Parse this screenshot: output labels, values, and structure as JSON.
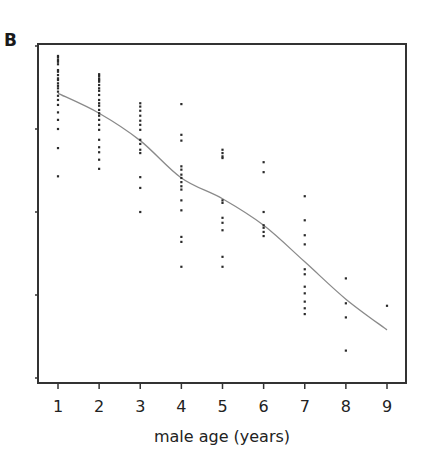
{
  "panel_label": "B",
  "chart_data": {
    "type": "scatter",
    "title": "",
    "xlabel": "male age (years)",
    "ylabel": "",
    "x_ticks": [
      1,
      2,
      3,
      4,
      5,
      6,
      7,
      8,
      9
    ],
    "y_ticks_unlabeled": [
      0,
      1,
      2,
      3,
      4
    ],
    "xlim": [
      0.55,
      9.45
    ],
    "ylim": [
      -0.06,
      4.02
    ],
    "grid": false,
    "legend": null,
    "series": [
      {
        "name": "observations",
        "type": "scatter",
        "points": [
          [
            1,
            3.88
          ],
          [
            1,
            3.86
          ],
          [
            1,
            3.83
          ],
          [
            1,
            3.81
          ],
          [
            1,
            3.78
          ],
          [
            1,
            3.71
          ],
          [
            1,
            3.69
          ],
          [
            1,
            3.65
          ],
          [
            1,
            3.61
          ],
          [
            1,
            3.59
          ],
          [
            1,
            3.55
          ],
          [
            1,
            3.52
          ],
          [
            1,
            3.49
          ],
          [
            1,
            3.45
          ],
          [
            1,
            3.4
          ],
          [
            1,
            3.35
          ],
          [
            1,
            3.29
          ],
          [
            1,
            3.2
          ],
          [
            1,
            3.11
          ],
          [
            1,
            3.0
          ],
          [
            1,
            2.77
          ],
          [
            1,
            2.43
          ],
          [
            2,
            3.66
          ],
          [
            2,
            3.64
          ],
          [
            2,
            3.61
          ],
          [
            2,
            3.59
          ],
          [
            2,
            3.57
          ],
          [
            2,
            3.53
          ],
          [
            2,
            3.49
          ],
          [
            2,
            3.46
          ],
          [
            2,
            3.41
          ],
          [
            2,
            3.35
          ],
          [
            2,
            3.31
          ],
          [
            2,
            3.28
          ],
          [
            2,
            3.23
          ],
          [
            2,
            3.19
          ],
          [
            2,
            3.16
          ],
          [
            2,
            3.11
          ],
          [
            2,
            3.05
          ],
          [
            2,
            2.99
          ],
          [
            2,
            2.87
          ],
          [
            2,
            2.78
          ],
          [
            2,
            2.72
          ],
          [
            2,
            2.63
          ],
          [
            2,
            2.52
          ],
          [
            3,
            3.31
          ],
          [
            3,
            3.27
          ],
          [
            3,
            3.22
          ],
          [
            3,
            3.16
          ],
          [
            3,
            3.1
          ],
          [
            3,
            3.05
          ],
          [
            3,
            2.99
          ],
          [
            3,
            2.87
          ],
          [
            3,
            2.82
          ],
          [
            3,
            2.75
          ],
          [
            3,
            2.71
          ],
          [
            3,
            2.42
          ],
          [
            3,
            2.29
          ],
          [
            3,
            2.0
          ],
          [
            4,
            3.3
          ],
          [
            4,
            2.93
          ],
          [
            4,
            2.86
          ],
          [
            4,
            2.55
          ],
          [
            4,
            2.51
          ],
          [
            4,
            2.45
          ],
          [
            4,
            2.41
          ],
          [
            4,
            2.36
          ],
          [
            4,
            2.31
          ],
          [
            4,
            2.27
          ],
          [
            4,
            2.14
          ],
          [
            4,
            2.02
          ],
          [
            4,
            1.7
          ],
          [
            4,
            1.64
          ],
          [
            4,
            1.34
          ],
          [
            5,
            2.75
          ],
          [
            5,
            2.71
          ],
          [
            5,
            2.67
          ],
          [
            5,
            2.65
          ],
          [
            5,
            2.14
          ],
          [
            5,
            2.11
          ],
          [
            5,
            1.93
          ],
          [
            5,
            1.87
          ],
          [
            5,
            1.78
          ],
          [
            5,
            1.46
          ],
          [
            5,
            1.34
          ],
          [
            6,
            2.6
          ],
          [
            6,
            2.48
          ],
          [
            6,
            2.0
          ],
          [
            6,
            1.84
          ],
          [
            6,
            1.81
          ],
          [
            6,
            1.76
          ],
          [
            6,
            1.71
          ],
          [
            7,
            2.19
          ],
          [
            7,
            1.9
          ],
          [
            7,
            1.72
          ],
          [
            7,
            1.61
          ],
          [
            7,
            1.31
          ],
          [
            7,
            1.25
          ],
          [
            7,
            1.1
          ],
          [
            7,
            1.02
          ],
          [
            7,
            0.92
          ],
          [
            7,
            0.84
          ],
          [
            7,
            0.77
          ],
          [
            8,
            1.2
          ],
          [
            8,
            0.9
          ],
          [
            8,
            0.73
          ],
          [
            8,
            0.33
          ],
          [
            9,
            0.87
          ]
        ]
      },
      {
        "name": "smoothed trend",
        "type": "line",
        "x": [
          1,
          2,
          3,
          4,
          5,
          6,
          7,
          8,
          9
        ],
        "y": [
          3.43,
          3.19,
          2.86,
          2.41,
          2.16,
          1.84,
          1.4,
          0.95,
          0.58
        ]
      }
    ]
  },
  "style": {
    "point_color": "#2a2a2a",
    "line_color": "#8a8a8a",
    "axis_color": "#333333"
  }
}
